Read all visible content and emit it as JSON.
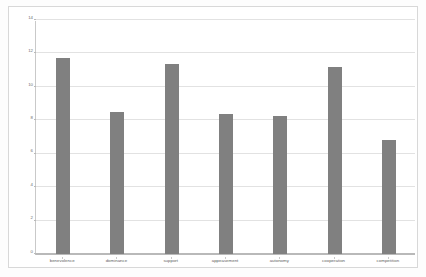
{
  "chart_data": {
    "type": "bar",
    "title": "",
    "subtitle": "",
    "xlabel": "",
    "ylabel": "",
    "categories": [
      "benevolence",
      "dominance",
      "support",
      "appeasement",
      "autonomy",
      "cooperation",
      "competition"
    ],
    "values": [
      11.7,
      8.5,
      11.35,
      8.4,
      8.25,
      11.2,
      6.8
    ],
    "ylim": [
      0,
      14
    ],
    "ytick_labels": [
      "0",
      "2",
      "4",
      "6",
      "8",
      "10",
      "12",
      "14"
    ],
    "ytick_values": [
      0,
      2,
      4,
      6,
      8,
      10,
      12,
      14
    ],
    "grid": true,
    "legend": false,
    "legend_position": "none",
    "bar_color": "#808080",
    "gridline_color": "#e2e2e2",
    "axis_color": "#b9b9b9",
    "plot_background": "#ffffff",
    "frame_color": "#d8d8d8"
  }
}
